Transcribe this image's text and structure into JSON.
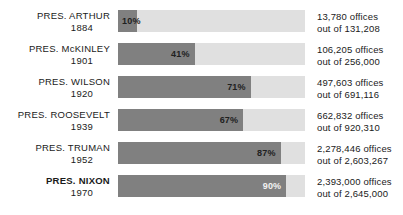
{
  "chart_data": {
    "type": "bar",
    "title": "",
    "subtitle": "",
    "xlabel": "",
    "ylabel": "",
    "orientation": "horizontal",
    "grid": false,
    "legend": null,
    "xlim": [
      0,
      100
    ],
    "unit": "%",
    "categories": [
      "PRES. ARTHUR 1884",
      "PRES. McKINLEY 1901",
      "PRES. WILSON 1920",
      "PRES. ROOSEVELT 1939",
      "PRES. TRUMAN 1952",
      "PRES. NIXON 1970"
    ],
    "values": [
      10,
      41,
      71,
      67,
      87,
      90
    ],
    "colors": {
      "fill": "#808080",
      "track": "#e0e0e0",
      "text": "#1a1a1a",
      "background": "#ffffff"
    },
    "annotations": [
      "13,780 offices out of 131,208",
      "106,205 offices out of 256,000",
      "497,603 offices out of 691,116",
      "662,832 offices out of 920,310",
      "2,278,446 offices out of 2,603,267",
      "2,393,000 offices out of 2,645,000"
    ]
  },
  "rows": [
    {
      "name": "PRES. ARTHUR",
      "year": "1884",
      "bold": false,
      "percent": 10,
      "percent_label": "10%",
      "label_position": "left",
      "label_color": "dark",
      "stat_top": "13,780 offices",
      "stat_bottom": "out of 131,208"
    },
    {
      "name": "PRES. McKINLEY",
      "year": "1901",
      "bold": false,
      "percent": 41,
      "percent_label": "41%",
      "label_position": "right",
      "label_color": "dark",
      "stat_top": "106,205 offices",
      "stat_bottom": "out of 256,000"
    },
    {
      "name": "PRES. WILSON",
      "year": "1920",
      "bold": false,
      "percent": 71,
      "percent_label": "71%",
      "label_position": "right",
      "label_color": "dark",
      "stat_top": "497,603 offices",
      "stat_bottom": "out of 691,116"
    },
    {
      "name": "PRES. ROOSEVELT",
      "year": "1939",
      "bold": false,
      "percent": 67,
      "percent_label": "67%",
      "label_position": "right",
      "label_color": "dark",
      "stat_top": "662,832 offices",
      "stat_bottom": "out of 920,310"
    },
    {
      "name": "PRES. TRUMAN",
      "year": "1952",
      "bold": false,
      "percent": 87,
      "percent_label": "87%",
      "label_position": "right",
      "label_color": "dark",
      "stat_top": "2,278,446 offices",
      "stat_bottom": "out of 2,603,267"
    },
    {
      "name": "PRES. NIXON",
      "year": "1970",
      "bold": true,
      "percent": 90,
      "percent_label": "90%",
      "label_position": "right",
      "label_color": "light",
      "stat_top": "2,393,000 offices",
      "stat_bottom": "out of 2,645,000"
    }
  ]
}
